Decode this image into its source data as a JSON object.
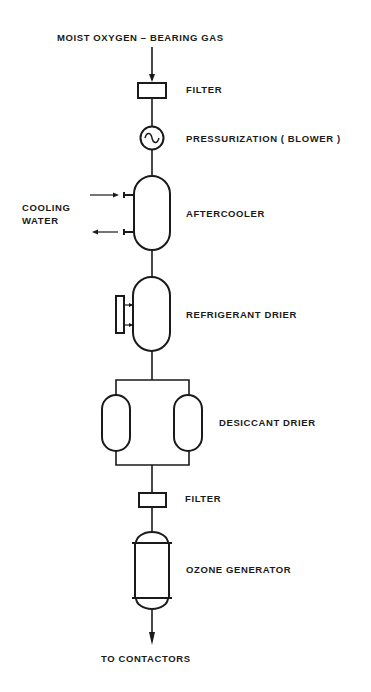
{
  "diagram": {
    "input_label": "MOIST  OXYGEN – BEARING  GAS",
    "output_label": "TO  CONTACTORS",
    "stages": [
      {
        "id": "filter-1",
        "label": "FILTER",
        "symbol": "filter-box"
      },
      {
        "id": "blower",
        "label": "PRESSURIZATION  ( BLOWER )",
        "symbol": "blower-circle"
      },
      {
        "id": "aftercooler",
        "label": "AFTERCOOLER",
        "symbol": "vessel"
      },
      {
        "id": "refrigerant-drier",
        "label": "REFRIGERANT  DRIER",
        "symbol": "vessel-with-side-unit"
      },
      {
        "id": "desiccant-drier",
        "label": "DESICCANT  DRIER",
        "symbol": "twin-vessels-parallel"
      },
      {
        "id": "filter-2",
        "label": "FILTER",
        "symbol": "filter-box"
      },
      {
        "id": "ozone-generator",
        "label": "OZONE  GENERATOR",
        "symbol": "capped-cylinder"
      }
    ],
    "side_inputs": {
      "cooling_water": {
        "line1": "COOLING",
        "line2": "WATER"
      }
    },
    "colors": {
      "line": "#1a1a1a",
      "background": "#ffffff"
    }
  }
}
